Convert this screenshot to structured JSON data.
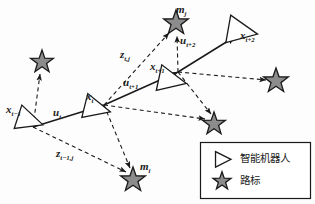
{
  "figure": {
    "type": "slam-pose-landmark-graph",
    "background_color": "#fdfdfd",
    "line_color": "#1a1a1a",
    "star_fill": "#8c8c8c",
    "star_stroke": "#1a1a1a",
    "robot_fill": "#ffffff",
    "robot_stroke": "#1a1a1a"
  },
  "labels": {
    "pose_prev": {
      "base": "x",
      "sub": "t−1",
      "x": 6,
      "y": 104,
      "size": 11
    },
    "pose_cur": {
      "base": "x",
      "sub": "t",
      "x": 86,
      "y": 91,
      "size": 11
    },
    "pose_next": {
      "base": "x",
      "sub": "t+1",
      "x": 150,
      "y": 61,
      "size": 11
    },
    "pose_next2": {
      "base": "x",
      "sub": "t+2",
      "x": 240,
      "y": 30,
      "size": 11
    },
    "ctrl_cur": {
      "base": "u",
      "sub": "t",
      "x": 53,
      "y": 107,
      "size": 11
    },
    "ctrl_next": {
      "base": "u",
      "sub": "t+1",
      "x": 123,
      "y": 77,
      "size": 11
    },
    "ctrl_next2": {
      "base": "u",
      "sub": "t+2",
      "x": 180,
      "y": 35,
      "size": 11
    },
    "meas_prev": {
      "base": "z",
      "sub": "t−1,j",
      "x": 56,
      "y": 148,
      "size": 11
    },
    "meas_cur": {
      "base": "z",
      "sub": "t,j",
      "x": 120,
      "y": 49,
      "size": 11
    },
    "landmark_i": {
      "base": "m",
      "sub": "i",
      "x": 140,
      "y": 161,
      "size": 11
    },
    "landmark_j": {
      "base": "m",
      "sub": "j",
      "x": 176,
      "y": 4,
      "size": 11
    }
  },
  "legend": {
    "box": {
      "x": 200,
      "y": 142,
      "w": 110,
      "h": 56
    },
    "items": [
      {
        "icon": "robot-triangle-icon",
        "label": "智能机器人"
      },
      {
        "icon": "landmark-star-icon",
        "label": "路标"
      }
    ]
  },
  "robots": [
    {
      "name": "robot-pose-t-minus-1",
      "cx": 28,
      "cy": 120,
      "r": 15,
      "rot": 18
    },
    {
      "name": "robot-pose-t",
      "cx": 95,
      "cy": 108,
      "r": 15,
      "rot": 14
    },
    {
      "name": "robot-pose-t-plus-1",
      "cx": 170,
      "cy": 80,
      "r": 16,
      "rot": 12
    },
    {
      "name": "robot-pose-t-plus-2",
      "cx": 240,
      "cy": 31,
      "r": 17,
      "rot": 10
    }
  ],
  "landmarks": [
    {
      "name": "landmark-upper-left",
      "cx": 42,
      "cy": 62,
      "r": 12
    },
    {
      "name": "landmark-top",
      "cx": 176,
      "cy": 23,
      "r": 13
    },
    {
      "name": "landmark-right",
      "cx": 276,
      "cy": 81,
      "r": 13
    },
    {
      "name": "landmark-mid-right",
      "cx": 214,
      "cy": 124,
      "r": 12
    },
    {
      "name": "landmark-bottom",
      "cx": 133,
      "cy": 180,
      "r": 13
    }
  ],
  "control_edges": [
    {
      "name": "control-edge-u-t",
      "from": [
        33,
        127
      ],
      "to": [
        104,
        105
      ]
    },
    {
      "name": "control-edge-u-t-plus-1",
      "from": [
        104,
        105
      ],
      "to": [
        178,
        72
      ]
    },
    {
      "name": "control-edge-u-t-plus-2",
      "from": [
        178,
        72
      ],
      "to": [
        236,
        36
      ]
    }
  ],
  "measurement_edges": [
    {
      "name": "measurement-edge-t-minus-1-to-upper-left",
      "from": [
        33,
        127
      ],
      "to": [
        40,
        74
      ]
    },
    {
      "name": "measurement-edge-t-minus-1-to-bottom",
      "from": [
        33,
        127
      ],
      "to": [
        126,
        172
      ]
    },
    {
      "name": "measurement-edge-t-to-bottom",
      "from": [
        104,
        105
      ],
      "to": [
        130,
        168
      ]
    },
    {
      "name": "measurement-edge-t-to-top",
      "from": [
        104,
        105
      ],
      "to": [
        169,
        33
      ]
    },
    {
      "name": "measurement-edge-t-to-mid-right",
      "from": [
        104,
        105
      ],
      "to": [
        205,
        119
      ]
    },
    {
      "name": "measurement-edge-t-plus-1-to-top",
      "from": [
        178,
        72
      ],
      "to": [
        177,
        36
      ]
    },
    {
      "name": "measurement-edge-t-plus-1-to-right",
      "from": [
        178,
        72
      ],
      "to": [
        266,
        80
      ]
    },
    {
      "name": "measurement-edge-t-plus-1-to-mid-right",
      "from": [
        178,
        72
      ],
      "to": [
        211,
        114
      ]
    }
  ]
}
